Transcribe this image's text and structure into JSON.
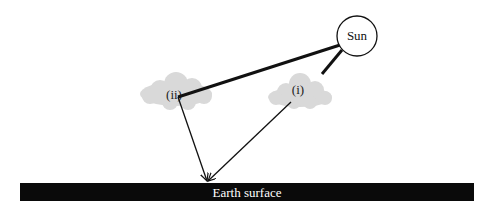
{
  "diagram": {
    "sun_label": "Sun",
    "cloud_ii_label": "(ii)",
    "cloud_i_label": "(i)",
    "earth_label": "Earth surface",
    "colors": {
      "line": "#111111",
      "cloud": "#d9d9d9",
      "earth": "#0a0a0a",
      "earth_text": "#ffffff",
      "sun_fill": "#ffffff"
    }
  }
}
